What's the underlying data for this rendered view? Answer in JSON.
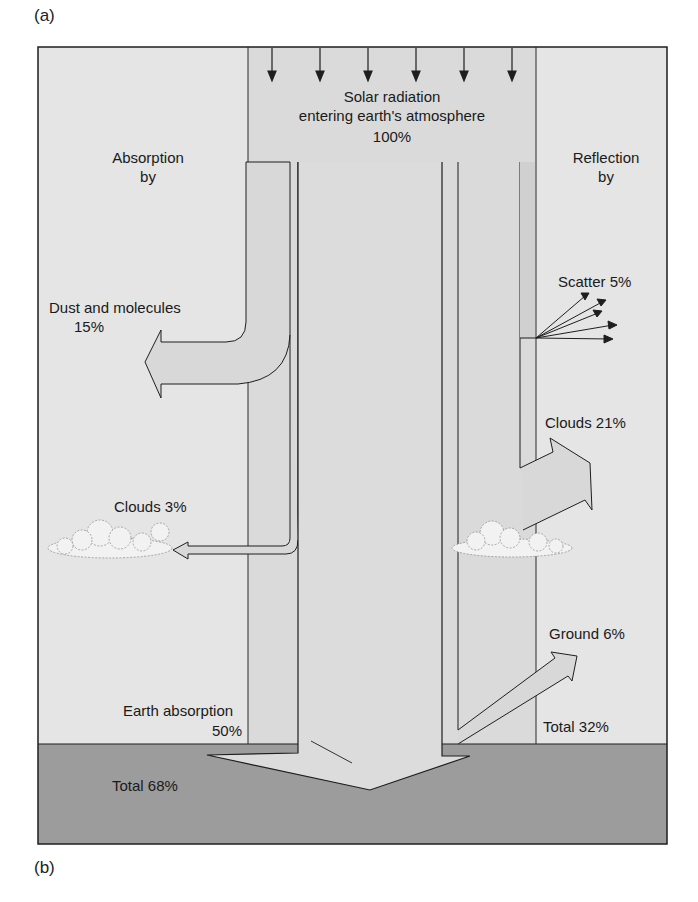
{
  "panel_labels": {
    "top": "(a)",
    "bottom": "(b)"
  },
  "solar": {
    "line1": "Solar radiation",
    "line2": "entering earth's atmosphere",
    "value": "100%"
  },
  "absorption": {
    "heading_line1": "Absorption",
    "heading_line2": "by",
    "dust": {
      "label": "Dust and molecules",
      "value": "15%"
    },
    "clouds": {
      "label": "Clouds 3%"
    },
    "earth": {
      "label": "Earth absorption",
      "value": "50%"
    },
    "total": "Total 68%"
  },
  "reflection": {
    "heading_line1": "Reflection",
    "heading_line2": "by",
    "scatter": {
      "label": "Scatter 5%"
    },
    "clouds": {
      "label": "Clouds 21%"
    },
    "ground": {
      "label": "Ground 6%"
    },
    "total": "Total 32%"
  },
  "colors": {
    "sky": "#e4e4e4",
    "column": "#d9d9d9",
    "arrow_fill": "#dcdcdc",
    "ground": "#9a9a9a",
    "line": "#1e1e1e"
  }
}
